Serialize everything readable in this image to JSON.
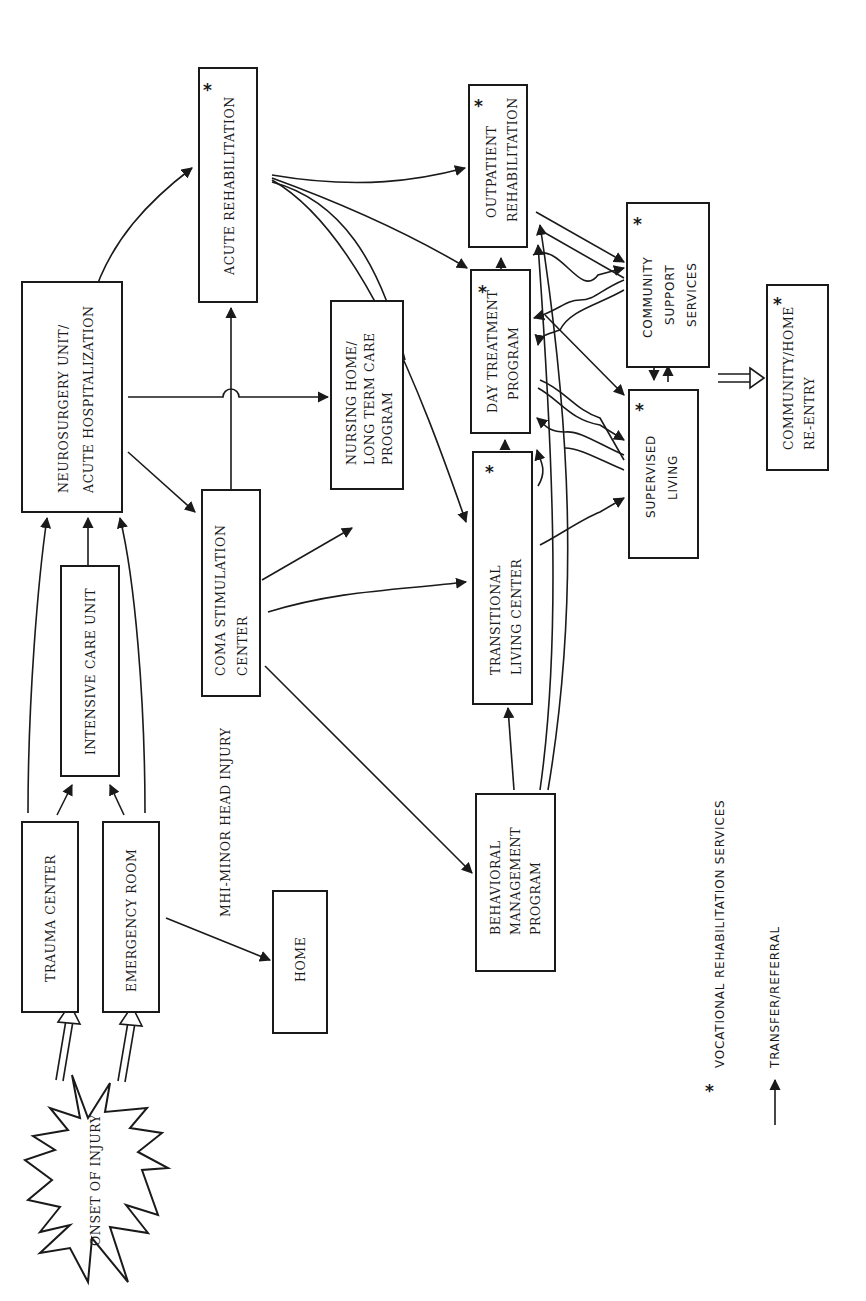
{
  "diagram": {
    "orientation": "rotated-90-ccw",
    "nodes": {
      "onset": {
        "label": "ONSET OF INJURY",
        "shape": "starburst"
      },
      "trauma_center": {
        "label": "TRAUMA CENTER",
        "vocational": false
      },
      "emergency_room": {
        "label": "EMERGENCY ROOM",
        "vocational": false
      },
      "icu": {
        "label": "INTENSIVE CARE UNIT",
        "vocational": false
      },
      "neurosurgery": {
        "line1": "NEUROSURGERY UNIT/",
        "line2": "ACUTE HOSPITALIZATION",
        "vocational": false
      },
      "acute_rehab": {
        "label": "ACUTE REHABILITATION",
        "vocational": true
      },
      "coma": {
        "line1": "COMA STIMULATION",
        "line2": "CENTER",
        "vocational": false
      },
      "nursing_home": {
        "line1": "NURSING HOME/",
        "line2": "LONG TERM CARE",
        "line3": "PROGRAM",
        "vocational": false
      },
      "home": {
        "label": "HOME",
        "vocational": false
      },
      "behavioral": {
        "line1": "BEHAVIORAL",
        "line2": "MANAGEMENT",
        "line3": "PROGRAM",
        "vocational": false
      },
      "transitional": {
        "line1": "TRANSITIONAL",
        "line2": "LIVING CENTER",
        "vocational": true
      },
      "day_treatment": {
        "line1": "DAY TREATMENT",
        "line2": "PROGRAM",
        "vocational": true
      },
      "outpatient": {
        "line1": "OUTPATIENT",
        "line2": "REHABILITATION",
        "vocational": true
      },
      "community_support": {
        "line1": "COMMUNITY",
        "line2": "SUPPORT",
        "line3": "SERVICES",
        "vocational": true
      },
      "supervised_living": {
        "line1": "SUPERVISED",
        "line2": "LIVING",
        "vocational": true
      },
      "community_home": {
        "line1": "COMMUNITY/HOME",
        "line2": "RE-ENTRY",
        "vocational": true
      }
    },
    "annotations": {
      "mhi": "MHI-MINOR HEAD INJURY"
    },
    "legend": {
      "star_symbol": "*",
      "star_text": "VOCATIONAL REHABILITATION SERVICES",
      "arrow_text": "TRANSFER/REFERRAL"
    },
    "edges": [
      [
        "onset",
        "trauma_center",
        "double-arrow"
      ],
      [
        "onset",
        "emergency_room",
        "double-arrow"
      ],
      [
        "trauma_center",
        "icu"
      ],
      [
        "emergency_room",
        "icu"
      ],
      [
        "trauma_center",
        "neurosurgery"
      ],
      [
        "emergency_room",
        "neurosurgery"
      ],
      [
        "icu",
        "neurosurgery"
      ],
      [
        "emergency_room",
        "home"
      ],
      [
        "neurosurgery",
        "acute_rehab"
      ],
      [
        "neurosurgery",
        "nursing_home"
      ],
      [
        "neurosurgery",
        "coma"
      ],
      [
        "coma",
        "acute_rehab"
      ],
      [
        "coma",
        "nursing_home"
      ],
      [
        "coma",
        "transitional"
      ],
      [
        "coma",
        "behavioral"
      ],
      [
        "acute_rehab",
        "outpatient"
      ],
      [
        "acute_rehab",
        "day_treatment"
      ],
      [
        "acute_rehab",
        "transitional"
      ],
      [
        "behavioral",
        "transitional"
      ],
      [
        "behavioral",
        "day_treatment"
      ],
      [
        "behavioral",
        "outpatient"
      ],
      [
        "transitional",
        "day_treatment"
      ],
      [
        "day_treatment",
        "outpatient"
      ],
      [
        "outpatient",
        "community_support"
      ],
      [
        "day_treatment",
        "community_support"
      ],
      [
        "community_support",
        "outpatient"
      ],
      [
        "community_support",
        "day_treatment"
      ],
      [
        "supervised_living",
        "outpatient"
      ],
      [
        "supervised_living",
        "day_treatment"
      ],
      [
        "day_treatment",
        "supervised_living"
      ],
      [
        "outpatient",
        "supervised_living"
      ],
      [
        "transitional",
        "supervised_living"
      ],
      [
        "community_support",
        "supervised_living"
      ],
      [
        "supervised_living",
        "community_support"
      ],
      [
        "supervised_living",
        "community_home",
        "double-arrow"
      ]
    ]
  }
}
